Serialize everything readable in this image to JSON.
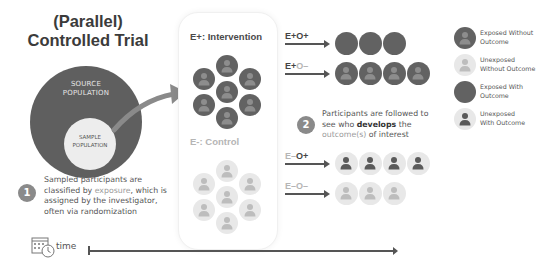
{
  "title": {
    "line1": "(Parallel)",
    "line2": "Controlled Trial"
  },
  "population": {
    "source_line1": "SOURCE",
    "source_line2": "POPULATION",
    "sample_line1": "SAMPLE",
    "sample_line2": "POPULATION"
  },
  "step1": {
    "number": "1",
    "text_a": "Sampled participants are classified by ",
    "text_highlight": "exposure",
    "text_b": ", which is assigned by the investigator, often via randomization"
  },
  "step2": {
    "number": "2",
    "text_a": "Participants are followed to see who ",
    "text_bold": "develops",
    "text_b": " the ",
    "text_highlight": "outcome(s)",
    "text_c": " of interest"
  },
  "groups": {
    "intervention": {
      "prefix": "E+:",
      "label": " Intervention"
    },
    "control": {
      "prefix": "E-:",
      "label": " Control"
    }
  },
  "rows": [
    {
      "e": "E+",
      "o": "O+",
      "count": 3
    },
    {
      "e": "E+",
      "o": "O–",
      "count": 4
    },
    {
      "e": "E–",
      "o": "O+",
      "count": 4
    },
    {
      "e": "E–",
      "o": "O–",
      "count": 3
    }
  ],
  "legend": [
    {
      "line1": "Exposed Without",
      "line2": "Outcome"
    },
    {
      "line1": "Unexposed",
      "line2": "Without Outcome"
    },
    {
      "line1": "Exposed With",
      "line2": "Outcome"
    },
    {
      "line1": "Unexposed",
      "line2": "With Outcome"
    }
  ],
  "timeline": {
    "label": "time",
    "icon": "calendar-clock-icon"
  },
  "colors": {
    "dark": "#626262",
    "light": "#e8e8e8",
    "text": "#4a4a4a",
    "muted": "#a0a0a0"
  }
}
